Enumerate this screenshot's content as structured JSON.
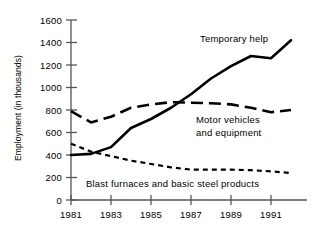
{
  "chart_data": {
    "type": "line",
    "title": "",
    "xlabel": "",
    "ylabel": "Employment (in thousands)",
    "xlim": [
      1981,
      1992
    ],
    "ylim": [
      0,
      1600
    ],
    "grid": false,
    "legend_position": "inline-annotations",
    "x": [
      1981,
      1982,
      1983,
      1984,
      1985,
      1986,
      1987,
      1988,
      1989,
      1990,
      1991,
      1992
    ],
    "xticks": [
      1981,
      1983,
      1985,
      1987,
      1989,
      1991
    ],
    "xtick_labels": [
      "1981",
      "1983",
      "1985",
      "1987",
      "1989",
      "1991"
    ],
    "yticks": [
      0,
      200,
      400,
      600,
      800,
      1000,
      1200,
      1400,
      1600
    ],
    "ytick_labels": [
      "0",
      "200",
      "400",
      "600",
      "800",
      "1000",
      "1200",
      "1400",
      "1600"
    ],
    "series": [
      {
        "name": "Temporary help",
        "style": "solid",
        "color": "#000000",
        "width": 2.6,
        "values": [
          400,
          410,
          470,
          640,
          720,
          820,
          940,
          1080,
          1190,
          1280,
          1260,
          1420
        ]
      },
      {
        "name": "Motor vehicles and equipment",
        "style": "long-dash",
        "color": "#000000",
        "width": 2.6,
        "values": [
          790,
          690,
          740,
          820,
          850,
          870,
          865,
          860,
          850,
          820,
          780,
          800
        ]
      },
      {
        "name": "Blast furnaces and basic steel products",
        "style": "short-dash",
        "color": "#000000",
        "width": 2.2,
        "values": [
          500,
          430,
          390,
          350,
          320,
          290,
          270,
          270,
          270,
          265,
          255,
          240
        ]
      }
    ],
    "annotations": [
      {
        "id": "temporary-help",
        "text": "Temporary help"
      },
      {
        "id": "motor-vehicles-line1",
        "text": "Motor vehicles"
      },
      {
        "id": "motor-vehicles-line2",
        "text": "and equipment"
      },
      {
        "id": "blast-furnaces",
        "text": "Blast furnaces and basic steel products"
      }
    ],
    "axis_color": "#444444",
    "background": "#ffffff"
  }
}
